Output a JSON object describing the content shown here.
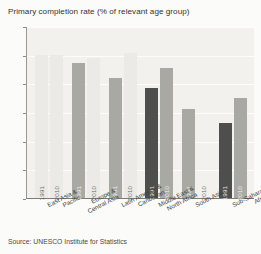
{
  "chart_data": {
    "type": "bar",
    "title": "Primary completion rate (% of relevant age group)",
    "xlabel": "",
    "ylabel": "",
    "ylim": [
      0,
      120
    ],
    "yticks": [
      0,
      20,
      40,
      60,
      80,
      100,
      120
    ],
    "grid": true,
    "legend": "none",
    "legend_position": "in-bar-labels",
    "categories": [
      "East Asia & Pacific",
      "Europe & Central Asia",
      "Latin America & Caribbean",
      "Middle East & North Africa",
      "South Asia",
      "Sub-Saharan Africa"
    ],
    "series": [
      {
        "name": "1991",
        "values": [
          100,
          94,
          84,
          77,
          62,
          52
        ]
      },
      {
        "name": "2010",
        "values": [
          100,
          98,
          101,
          91,
          null,
          70
        ]
      }
    ],
    "bars": [
      {
        "category": "East Asia & Pacific",
        "year": "1991",
        "value": 100,
        "shade": "light"
      },
      {
        "category": "East Asia & Pacific",
        "year": "2010",
        "value": 100,
        "shade": "light"
      },
      {
        "category": "Europe & Central Asia",
        "year": "1991",
        "value": 94,
        "shade": "mid"
      },
      {
        "category": "Europe & Central Asia",
        "year": "2010",
        "value": 98,
        "shade": "light"
      },
      {
        "category": "Latin America & Caribbean",
        "year": "1991",
        "value": 84,
        "shade": "mid"
      },
      {
        "category": "Latin America & Caribbean",
        "year": "2010",
        "value": 101,
        "shade": "light"
      },
      {
        "category": "Middle East & North Africa",
        "year": "1991",
        "value": 77,
        "shade": "dark"
      },
      {
        "category": "Middle East & North Africa",
        "year": "2010",
        "value": 91,
        "shade": "mid"
      },
      {
        "category": "South Asia",
        "year": "1991",
        "value": 62,
        "shade": "mid"
      },
      {
        "category": "South Asia",
        "year": "2010",
        "value": null,
        "shade": "empty"
      },
      {
        "category": "Sub-Saharan Africa",
        "year": "1991",
        "value": 52,
        "shade": "dark"
      },
      {
        "category": "Sub-Saharan Africa",
        "year": "2010",
        "value": 70,
        "shade": "mid"
      }
    ],
    "category_lines": [
      [
        "East Asia &",
        "Pacific"
      ],
      [
        "Europe &",
        "Central Asia"
      ],
      [
        "Latin America &",
        "Caribbean"
      ],
      [
        "Middle East &",
        "North Africa"
      ],
      [
        "South Asia",
        ""
      ],
      [
        "Sub-Saharan",
        "Africa"
      ]
    ]
  },
  "colors": {
    "bar_light": "#ebeae6",
    "bar_mid": "#a9a9a3",
    "bar_dark": "#4e4e4c",
    "plot_background": "#f2f1ee",
    "page_background": "#fbfbf9",
    "gridline": "#ffffff",
    "axis": "#7d7d78",
    "text": "#3c3c3c"
  },
  "source": {
    "text": "Source: UNESCO Institute for Statistics"
  }
}
